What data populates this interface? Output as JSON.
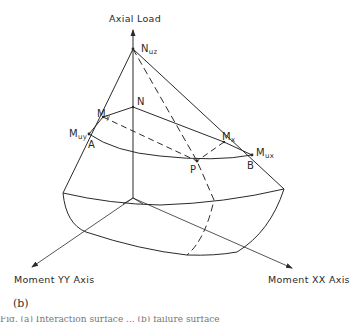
{
  "figure": {
    "panel_label": "(b)",
    "axes": {
      "vertical": "Axial Load",
      "moment_yy": "Moment YY Axis",
      "moment_xx": "Moment XX Axis"
    },
    "points": {
      "nuz": {
        "main": "N",
        "sub": "uz"
      },
      "n": {
        "main": "N",
        "sub": ""
      },
      "my": {
        "main": "M",
        "sub": "y"
      },
      "muy": {
        "main": "M",
        "sub": "uy"
      },
      "a": {
        "main": "A",
        "sub": ""
      },
      "mx": {
        "main": "M",
        "sub": "x"
      },
      "mux": {
        "main": "M",
        "sub": "ux"
      },
      "b": {
        "main": "B",
        "sub": ""
      },
      "p": {
        "main": "P",
        "sub": ""
      }
    },
    "caption_fragment": "Fig. (a) Interaction surface ... (b) failure surface"
  },
  "colors": {
    "line": "#2a2a2a",
    "background": "#ffffff"
  }
}
